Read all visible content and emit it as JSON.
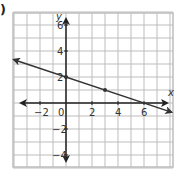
{
  "problem": {
    "label": ")"
  },
  "chart_data": {
    "type": "line",
    "title": "",
    "xlabel": "x",
    "ylabel": "y",
    "xlim": [
      -4,
      8
    ],
    "ylim": [
      -5,
      7
    ],
    "grid": true,
    "x_ticks": [
      "-2",
      "0",
      "2",
      "4",
      "6"
    ],
    "y_ticks": [
      "6",
      "4",
      "2",
      "-2",
      "-4"
    ],
    "series": [
      {
        "name": "y = -1/3 x + 2",
        "equation": "y = -x/3 + 2",
        "slope": -0.3333,
        "intercept": 2,
        "x_intercept": 6,
        "marked_points": [
          {
            "x": 0,
            "y": 2
          },
          {
            "x": 3,
            "y": 1
          }
        ],
        "x": [
          -4,
          8
        ],
        "y": [
          3.33,
          -0.67
        ]
      }
    ],
    "colors": {
      "grid": "#bdbdbd",
      "axes": "#222222",
      "line": "#333333"
    }
  }
}
